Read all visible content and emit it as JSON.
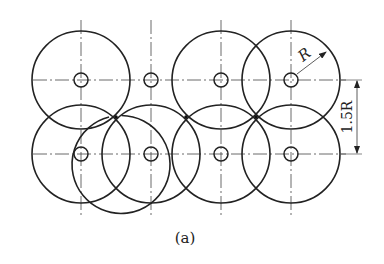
{
  "figure": {
    "caption": "(a)",
    "radius_label": "R",
    "spacing_label": "1.5R",
    "grid": {
      "rows": 2,
      "cols": 4
    },
    "centers_x": [
      81,
      151,
      221,
      291
    ],
    "centers_y": [
      80,
      154
    ],
    "radius": 49,
    "hole_radius": 7,
    "colors": {
      "stroke": "#222222",
      "background": "#ffffff"
    }
  }
}
